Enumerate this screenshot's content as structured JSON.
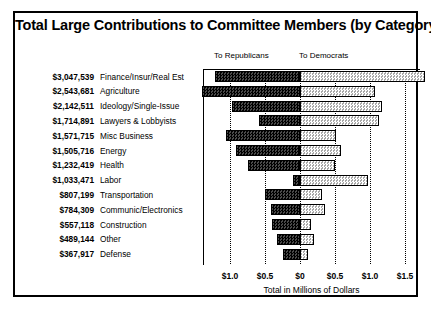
{
  "chart_data": {
    "type": "bar",
    "orientation": "horizontal",
    "stacked": "diverging",
    "title": "Total Large Contributions to Committee Members (by Category)",
    "xlabel": "Total in Millions of Dollars",
    "ylabel": "",
    "grid": true,
    "legend_position": "top",
    "xlim": [
      -1.25,
      1.75
    ],
    "xticks": [
      -1.0,
      -0.5,
      0,
      0.5,
      1.0,
      1.5
    ],
    "xticklabels": [
      "$1.0",
      "$0.5",
      "$0",
      "$0.5",
      "$1.0",
      "$1.5"
    ],
    "legend": [
      "To Republicans",
      "To Democrats"
    ],
    "categories": [
      "Finance/Insur/Real Est",
      "Agriculture",
      "Ideology/Single-Issue",
      "Lawyers & Lobbyists",
      "Misc Business",
      "Energy",
      "Health",
      "Labor",
      "Transportation",
      "Communic/Electronics",
      "Construction",
      "Other",
      "Defense"
    ],
    "totals_formatted": [
      "$3,047,539",
      "$2,543,681",
      "$2,142,511",
      "$1,714,891",
      "$1,571,715",
      "$1,505,716",
      "$1,232,419",
      "$1,033,471",
      "$807,199",
      "$784,309",
      "$557,118",
      "$489,144",
      "$367,917"
    ],
    "totals": [
      3047539,
      2543681,
      2142511,
      1714891,
      1571715,
      1505716,
      1232419,
      1033471,
      807199,
      784309,
      557118,
      489144,
      367917
    ],
    "series": [
      {
        "name": "To Republicans",
        "direction": "left",
        "values": [
          1.21,
          1.4,
          0.97,
          0.58,
          1.06,
          0.92,
          0.74,
          0.1,
          0.5,
          0.42,
          0.4,
          0.33,
          0.25
        ]
      },
      {
        "name": "To Democrats",
        "direction": "right",
        "values": [
          1.78,
          1.07,
          1.17,
          1.13,
          0.52,
          0.59,
          0.5,
          0.97,
          0.31,
          0.36,
          0.15,
          0.2,
          0.12
        ]
      }
    ]
  },
  "axis": {
    "title": "Total in Millions of Dollars"
  },
  "legend": {
    "republicans": "To Republicans",
    "democrats": "To Democrats"
  }
}
